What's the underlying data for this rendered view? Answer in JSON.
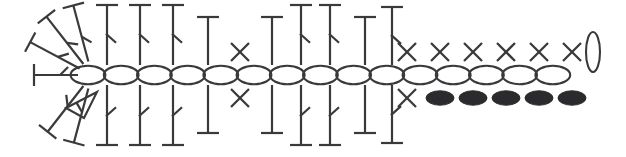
{
  "diagram": {
    "background_color": "#ffffff",
    "stroke_color": "#3a3a3c",
    "fill_color": "#2b2b2d",
    "center_row_y": 75,
    "legend": {
      "chain": "chain-stitch-oval",
      "single_crochet": "single-crochet-x",
      "half_double_crochet": "half-double-crochet-t",
      "double_crochet": "double-crochet-t-tick",
      "slip_stitch": "slip-stitch-oval-filled",
      "picot_triangle": "triangle-marker"
    },
    "chain_row": {
      "name": "chain-stitch-row",
      "count": 15,
      "start_x": 88,
      "step": 33.2,
      "rx": 17.4,
      "ry": 9.2
    },
    "top_stitches": [
      {
        "type": "double-crochet",
        "x": 107,
        "height": 60,
        "tick": true
      },
      {
        "type": "double-crochet",
        "x": 140,
        "height": 60,
        "tick": true
      },
      {
        "type": "double-crochet",
        "x": 173,
        "height": 60,
        "tick": true
      },
      {
        "type": "half-double-crochet",
        "x": 208,
        "height": 48,
        "tick": false
      },
      {
        "type": "single-crochet",
        "x": 240,
        "height": 0,
        "tick": false
      },
      {
        "type": "half-double-crochet",
        "x": 272,
        "height": 48,
        "tick": false
      },
      {
        "type": "double-crochet",
        "x": 301,
        "height": 60,
        "tick": true
      },
      {
        "type": "double-crochet",
        "x": 330,
        "height": 60,
        "tick": true
      },
      {
        "type": "half-double-crochet",
        "x": 365,
        "height": 48,
        "tick": false
      },
      {
        "type": "double-crochet",
        "x": 392,
        "height": 58,
        "tick": true
      }
    ],
    "bottom_stitches": [
      {
        "type": "double-crochet",
        "x": 107,
        "height": 60,
        "tick": true
      },
      {
        "type": "double-crochet",
        "x": 140,
        "height": 60,
        "tick": true
      },
      {
        "type": "double-crochet",
        "x": 173,
        "height": 60,
        "tick": true
      },
      {
        "type": "half-double-crochet",
        "x": 208,
        "height": 48,
        "tick": false
      },
      {
        "type": "single-crochet",
        "x": 240,
        "height": 0,
        "tick": false
      },
      {
        "type": "half-double-crochet",
        "x": 272,
        "height": 48,
        "tick": false
      },
      {
        "type": "double-crochet",
        "x": 301,
        "height": 60,
        "tick": true
      },
      {
        "type": "double-crochet",
        "x": 330,
        "height": 60,
        "tick": true
      },
      {
        "type": "half-double-crochet",
        "x": 365,
        "height": 48,
        "tick": false
      },
      {
        "type": "double-crochet",
        "x": 392,
        "height": 58,
        "tick": true
      }
    ],
    "top_right_x_marks": {
      "name": "single-crochet-row-top",
      "count": 6,
      "start_x": 407,
      "step": 33,
      "y": 52,
      "size": 9
    },
    "bottom_right_x_marks": {
      "name": "single-crochet-row-bottom",
      "count": 1,
      "start_x": 407,
      "step": 33,
      "y": 98,
      "size": 9
    },
    "bottom_filled_ovals": {
      "name": "slip-stitch-row",
      "count": 5,
      "start_x": 440,
      "step": 33,
      "y": 98,
      "rx": 14,
      "ry": 7.2
    },
    "end_oval": {
      "name": "end-chain-oval",
      "cx": 593,
      "cy": 52,
      "rx": 7,
      "ry": 20
    },
    "fan_left": {
      "name": "left-fan-cluster",
      "hub_x": 92,
      "hub_y": 75,
      "spokes": [
        {
          "angle": 180,
          "length": 58,
          "label": "double-crochet-left"
        },
        {
          "angle": 208,
          "length": 70,
          "label": "double-crochet-upleft-outer"
        },
        {
          "angle": 232,
          "length": 74,
          "label": "double-crochet-upleft-inner"
        },
        {
          "angle": 255,
          "length": 72,
          "label": "double-crochet-up-slant"
        },
        {
          "angle": 128,
          "length": 72,
          "label": "double-crochet-downleft"
        },
        {
          "angle": 105,
          "length": 70,
          "label": "double-crochet-down-slant"
        }
      ],
      "triangle": {
        "name": "triangle-marker",
        "points": "66,108 97,92 84,118"
      }
    }
  }
}
